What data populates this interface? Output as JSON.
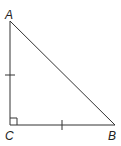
{
  "diagram": {
    "type": "right-triangle",
    "vertices": {
      "A": {
        "label": "A",
        "x": 10,
        "y": 21
      },
      "B": {
        "label": "B",
        "x": 115,
        "y": 125
      },
      "C": {
        "label": "C",
        "x": 10,
        "y": 125
      }
    },
    "right_angle_at": "C",
    "congruent_sides": [
      "AC",
      "CB"
    ],
    "stroke_color": "#333333"
  }
}
